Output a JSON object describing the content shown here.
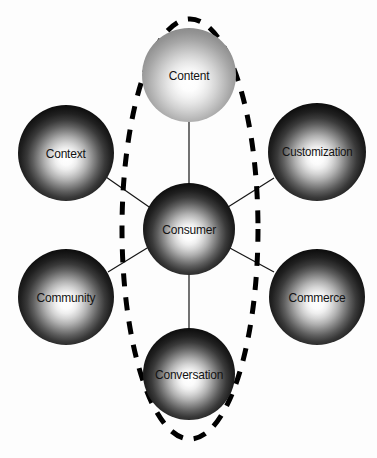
{
  "diagram": {
    "background_color": "#fdfdfd",
    "center_node": {
      "id": "consumer",
      "label": "Consumer",
      "cx": 189,
      "cy": 229,
      "r": 46,
      "style": "dark"
    },
    "nodes": [
      {
        "id": "content",
        "label": "Content",
        "cx": 189,
        "cy": 75,
        "r": 47,
        "style": "light",
        "inside_highlight": true
      },
      {
        "id": "context",
        "label": "Context",
        "cx": 66,
        "cy": 153,
        "r": 48,
        "style": "dark",
        "inside_highlight": false
      },
      {
        "id": "customization",
        "label": "Customization",
        "cx": 317,
        "cy": 152,
        "r": 49,
        "style": "dark",
        "inside_highlight": false
      },
      {
        "id": "community",
        "label": "Community",
        "cx": 66,
        "cy": 297,
        "r": 48,
        "style": "dark",
        "inside_highlight": false
      },
      {
        "id": "commerce",
        "label": "Commerce",
        "cx": 317,
        "cy": 297,
        "r": 48,
        "style": "dark",
        "inside_highlight": false
      },
      {
        "id": "conversation",
        "label": "Conversation",
        "cx": 189,
        "cy": 374,
        "r": 46,
        "style": "dark",
        "inside_highlight": true
      }
    ],
    "connectors": [
      {
        "from": "content",
        "to": "consumer",
        "x1": 189,
        "y1": 122,
        "x2": 189,
        "y2": 183
      },
      {
        "from": "conversation",
        "to": "consumer",
        "x1": 189,
        "y1": 275,
        "x2": 189,
        "y2": 328
      },
      {
        "from": "context",
        "to": "consumer",
        "x1": 106,
        "y1": 177,
        "x2": 152,
        "y2": 209
      },
      {
        "from": "customization",
        "to": "consumer",
        "x1": 274,
        "y1": 178,
        "x2": 228,
        "y2": 207
      },
      {
        "from": "community",
        "to": "consumer",
        "x1": 108,
        "y1": 272,
        "x2": 152,
        "y2": 245
      },
      {
        "from": "commerce",
        "to": "consumer",
        "x1": 274,
        "y1": 272,
        "x2": 228,
        "y2": 247
      }
    ],
    "highlight_ellipse": {
      "name": "dashed-highlight-ellipse",
      "cx": 190,
      "cy": 229,
      "rx": 68,
      "ry": 210,
      "stroke": "#000000",
      "stroke_width": 5,
      "dash": "13 11",
      "encircles": [
        "content",
        "consumer",
        "conversation"
      ]
    },
    "line_color": "#151515",
    "line_width": 1.2
  }
}
